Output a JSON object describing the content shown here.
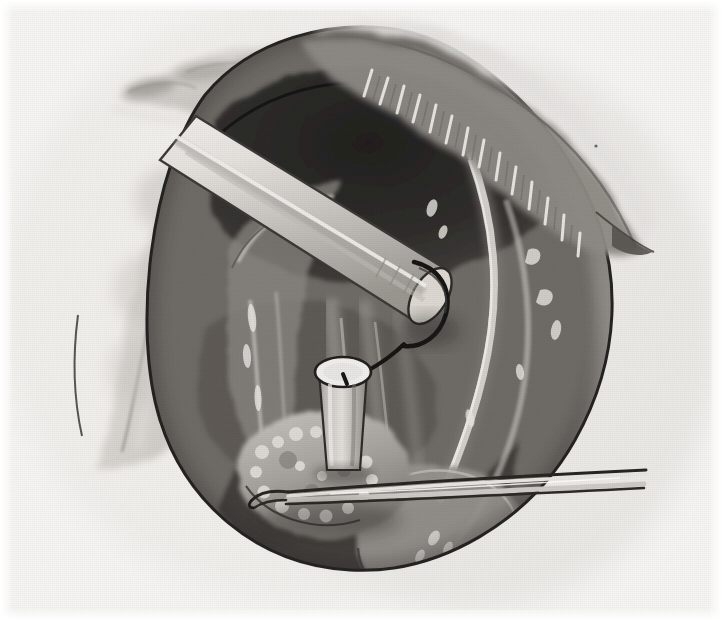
{
  "image": {
    "kind": "medical-surgical-illustration",
    "medium": "grayscale watercolor wash and ink line",
    "title": "Operative field illustration: exposed cavity with cannula, probe and forceps",
    "width": 722,
    "height": 620,
    "background_color": "#f7f6f4",
    "ink_color": "#1d1d1d",
    "has_text_labels": false,
    "visible_text": ""
  },
  "palette": {
    "paper": "#f7f6f4",
    "paper_warm": "#efedea",
    "wash_lightest": "#e2e0dc",
    "wash_light": "#cfccc7",
    "wash_mid": "#b2aea9",
    "wash_mid_dark": "#8e8a85",
    "wash_dark": "#6d6964",
    "wash_darker": "#514e4a",
    "cavity_shadow": "#3b3936",
    "cavity_deep": "#2b2a27",
    "ink": "#1d1d1d",
    "highlight": "#f2f1ee",
    "instrument_steel": "#dedbd6",
    "instrument_steel_shade": "#a9a6a1"
  },
  "regions": [
    {
      "id": "fat-lobules-upper-left",
      "name": "Lobulated fatty tissue at upper left",
      "tone": "#c9c6c1",
      "description": "Soft pale lobules of adipose tissue fading into the paper at the top left corner"
    },
    {
      "id": "retracted-flap-left",
      "name": "Retracted tissue flap, left",
      "tone": "#d8d5d0",
      "description": "Large pale crescent of retracted tissue sweeping from upper centre down to the lower left"
    },
    {
      "id": "cut-edge-upper-right",
      "name": "Cut tissue edge with hatched serration, upper right",
      "tone": "#8e8a85",
      "description": "Obliquely divided tissue margin showing fine comb-like hatching along the cut border"
    },
    {
      "id": "cavity-dark",
      "name": "Deep shadowed cavity",
      "tone": "#2b2a27",
      "description": "Darkest wedge of the operative cavity behind the retractor tube"
    },
    {
      "id": "cavity-wall-right",
      "name": "Right cavity wall",
      "tone": "#6d6964",
      "description": "Mid grey curved wall of the cavity on the right, with pale serosal glints"
    },
    {
      "id": "vessel-vertical-right",
      "name": "Vertical vessel, right",
      "tone": "#d2cfca",
      "description": "Pale sinuous vessel descending the right side of the cavity"
    },
    {
      "id": "vessel-bundle-centre",
      "name": "Central vessel bundle",
      "tone": "#b2aea9",
      "description": "Band of parallel vessels running vertically under the cannula"
    },
    {
      "id": "nodular-mass",
      "name": "Nodular tissue mass at base",
      "tone": "#a5a19c",
      "description": "Cobblestone cluster of pale nodules at the base of the cavity, grasped by forceps"
    },
    {
      "id": "lobe-lower-right",
      "name": "Rounded lobe, lower right",
      "tone": "#9a9691",
      "description": "Smooth rounded organ lobe below the forceps on the right"
    }
  ],
  "instruments": [
    {
      "id": "retractor-tube",
      "name": "Large retractor / endoscope tube",
      "orientation": "diagonal from upper left to lower right",
      "tone": "#e0ddd8",
      "has_dark_tip_loop": true,
      "description": "Broad pale cylindrical instrument entering from the upper left, its bevelled tip ringed by a dark loop"
    },
    {
      "id": "cannula-cylinder",
      "name": "Vertical cannula with open lumen",
      "orientation": "vertical, centre of field",
      "tone": "#dedbd6",
      "lumen_tone": "#f2f1ee",
      "description": "Short upright cylinder with a bright elliptical open top through which a probe passes"
    },
    {
      "id": "probe-wire",
      "name": "Fine probe / guide wire",
      "tone": "#1d1d1d",
      "description": "Thin dark probe running from the retractor tip down into the cannula lumen"
    },
    {
      "id": "forceps",
      "name": "Long fine forceps",
      "orientation": "horizontal, entering from the right margin",
      "tone": "#cfccc7",
      "description": "Slender two-bladed forceps crossing the lower field and grasping the nodular mass"
    }
  ],
  "composition": {
    "focal_point": "central cannula with probe",
    "lighting": "diffuse from upper left",
    "margins": "white paper border on all four sides",
    "caption": ""
  }
}
